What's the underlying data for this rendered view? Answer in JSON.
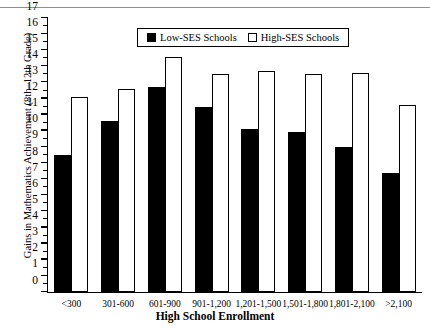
{
  "chart_data": {
    "type": "bar",
    "title": "",
    "xlabel": "High School Enrollment",
    "ylabel": "Gains in Mathematics Achievement (8th–12th Grade)",
    "categories": [
      "<300",
      "301-600",
      "601-900",
      "901-1,200",
      "1,201-1,500",
      "1,501-1,800",
      "1,801-2,100",
      ">2,100"
    ],
    "series": [
      {
        "name": "Low-SES Schools",
        "color": "#000000",
        "values": [
          8.5,
          10.6,
          12.7,
          11.5,
          10.1,
          9.9,
          9.0,
          7.4
        ]
      },
      {
        "name": "High-SES Schools",
        "color": "#ffffff",
        "values": [
          12.1,
          12.6,
          14.6,
          13.5,
          13.7,
          13.5,
          13.6,
          11.6
        ]
      }
    ],
    "ylim": [
      0,
      17
    ],
    "yticks": [
      0,
      1,
      2,
      3,
      4,
      5,
      6,
      7,
      8,
      9,
      10,
      11,
      12,
      13,
      14,
      15,
      16,
      17
    ],
    "grid": false,
    "legend_position": "top-center"
  },
  "legend": {
    "items": [
      {
        "label": "Low-SES Schools",
        "swatch": "filled"
      },
      {
        "label": "High-SES Schools",
        "swatch": "open"
      }
    ]
  },
  "top_remnant": {
    "text": "° °"
  }
}
